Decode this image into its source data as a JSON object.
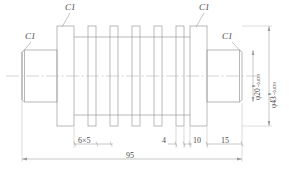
{
  "drawing": {
    "type": "mechanical-part-orthographic-view",
    "title": "Finned shaft / grooved roller",
    "stroke_color": "#9a9a9a",
    "text_color": "#4a4a4a",
    "background": "#ffffff"
  },
  "chamfer_labels": [
    {
      "id": "c1-left",
      "text": "C1"
    },
    {
      "id": "c1-top-left",
      "text": "C1"
    },
    {
      "id": "c1-top-right",
      "text": "C1"
    },
    {
      "id": "c1-right",
      "text": "C1"
    }
  ],
  "linear_dimensions": [
    {
      "id": "groove-pitch",
      "text": "6×5"
    },
    {
      "id": "fin-width",
      "text": "4"
    },
    {
      "id": "flange-width",
      "text": "10"
    },
    {
      "id": "shaft-right",
      "text": "15"
    },
    {
      "id": "overall-length",
      "text": "95"
    }
  ],
  "diameter_dimensions": [
    {
      "id": "dia-20",
      "text": "φ20",
      "tol_upper": "0",
      "tol_lower": "−0.033"
    },
    {
      "id": "dia-43",
      "text": "φ43",
      "tol_upper": "0",
      "tol_lower": "−0.033"
    }
  ]
}
